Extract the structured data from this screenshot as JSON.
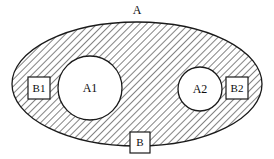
{
  "diagram": {
    "type": "set-diagram",
    "title_label": "A",
    "background_color": "#ffffff",
    "stroke_color": "#1a1a1a",
    "hatch_color": "#555555",
    "fill_color": "#ffffff",
    "outer_set": {
      "name": "A",
      "label": "A",
      "shape": "ellipse",
      "cx": 137,
      "cy": 84,
      "rx": 125,
      "ry": 62,
      "hatched": true,
      "hatch_direction": "backslash",
      "label_x": 137,
      "label_y": 11
    },
    "inner_sets": [
      {
        "name": "A1",
        "label": "A1",
        "shape": "circle",
        "cx": 90,
        "cy": 88,
        "r": 32,
        "hatched": false,
        "label_x": 90,
        "label_y": 89
      },
      {
        "name": "A2",
        "label": "A2",
        "shape": "circle",
        "cx": 200,
        "cy": 89,
        "r": 22,
        "hatched": false,
        "label_x": 200,
        "label_y": 90
      }
    ],
    "boxes": [
      {
        "name": "B1",
        "label": "B1",
        "shape": "rect",
        "x": 28,
        "y": 77,
        "width": 22,
        "height": 22,
        "label_x": 39,
        "label_y": 89
      },
      {
        "name": "B2",
        "label": "B2",
        "shape": "rect",
        "x": 226,
        "y": 77,
        "width": 22,
        "height": 22,
        "label_x": 237,
        "label_y": 89
      },
      {
        "name": "B",
        "label": "B",
        "shape": "rect",
        "x": 130,
        "y": 132,
        "width": 20,
        "height": 21,
        "label_x": 140,
        "label_y": 143
      }
    ]
  }
}
